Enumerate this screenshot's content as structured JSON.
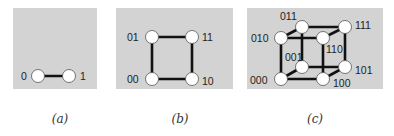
{
  "figure": {
    "colors": {
      "panel": "#d3d3d3",
      "edge": "#111111",
      "node": "#ffffff",
      "text": "#222222"
    },
    "panels": [
      {
        "id": "a",
        "caption": "(a)",
        "title": "1-dimensional hypercube",
        "nodes": [
          {
            "label": "0",
            "x": 38,
            "y": 76
          },
          {
            "label": "1",
            "x": 69,
            "y": 76
          }
        ],
        "edges": [
          [
            "0",
            "1"
          ]
        ]
      },
      {
        "id": "b",
        "caption": "(b)",
        "title": "2-dimensional hypercube",
        "nodes": [
          {
            "label": "01",
            "x": 152,
            "y": 37
          },
          {
            "label": "11",
            "x": 192,
            "y": 37
          },
          {
            "label": "00",
            "x": 152,
            "y": 79
          },
          {
            "label": "10",
            "x": 192,
            "y": 79
          }
        ],
        "edges": [
          [
            "00",
            "01"
          ],
          [
            "01",
            "11"
          ],
          [
            "11",
            "10"
          ],
          [
            "10",
            "00"
          ]
        ]
      },
      {
        "id": "c",
        "caption": "(c)",
        "title": "3-dimensional hypercube",
        "nodes": [
          {
            "label": "011",
            "x": 302,
            "y": 27
          },
          {
            "label": "111",
            "x": 345,
            "y": 27
          },
          {
            "label": "010",
            "x": 281,
            "y": 38
          },
          {
            "label": "110",
            "x": 323,
            "y": 38
          },
          {
            "label": "001",
            "x": 302,
            "y": 67
          },
          {
            "label": "101",
            "x": 345,
            "y": 67
          },
          {
            "label": "000",
            "x": 281,
            "y": 79
          },
          {
            "label": "100",
            "x": 323,
            "y": 79
          }
        ],
        "edges": [
          [
            "000",
            "010"
          ],
          [
            "010",
            "110"
          ],
          [
            "110",
            "100"
          ],
          [
            "100",
            "000"
          ],
          [
            "001",
            "011"
          ],
          [
            "011",
            "111"
          ],
          [
            "111",
            "101"
          ],
          [
            "101",
            "001"
          ],
          [
            "000",
            "001"
          ],
          [
            "010",
            "011"
          ],
          [
            "110",
            "111"
          ],
          [
            "100",
            "101"
          ]
        ]
      }
    ]
  }
}
